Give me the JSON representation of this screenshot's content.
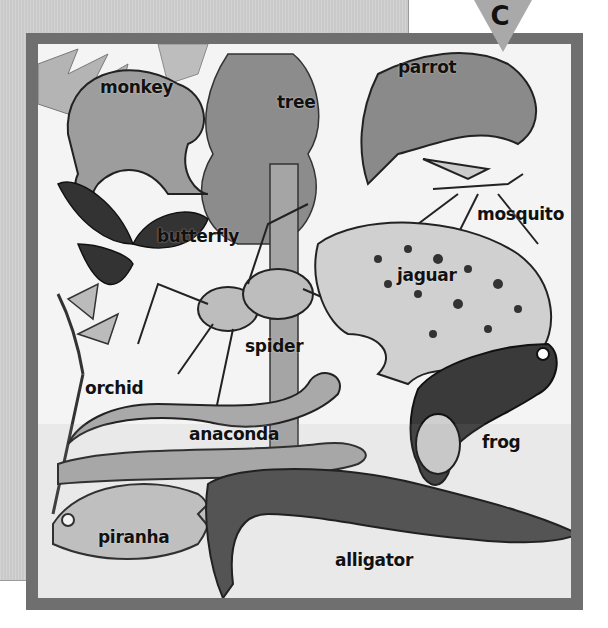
{
  "section_marker": {
    "letter": "C"
  },
  "labels": [
    {
      "id": "monkey",
      "text": "monkey"
    },
    {
      "id": "tree",
      "text": "tree"
    },
    {
      "id": "parrot",
      "text": "parrot"
    },
    {
      "id": "mosquito",
      "text": "mosquito"
    },
    {
      "id": "butterfly",
      "text": "butterfly"
    },
    {
      "id": "jaguar",
      "text": "jaguar"
    },
    {
      "id": "spider",
      "text": "spider"
    },
    {
      "id": "orchid",
      "text": "orchid"
    },
    {
      "id": "anaconda",
      "text": "anaconda"
    },
    {
      "id": "frog",
      "text": "frog"
    },
    {
      "id": "piranha",
      "text": "piranha"
    },
    {
      "id": "alligator",
      "text": "alligator"
    }
  ],
  "colors": {
    "frame": "#6f6f6f",
    "panel": "#c9c9c9",
    "marker": "#a9a9a9"
  }
}
